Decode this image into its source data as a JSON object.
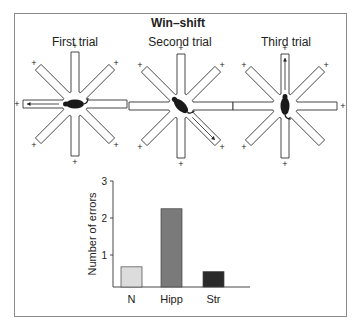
{
  "figure": {
    "title": "Win–shift",
    "trials": [
      {
        "label": "First trial",
        "rewarded_arms": [
          "N",
          "NE",
          "E",
          "SE",
          "S",
          "SW",
          "W",
          "NW"
        ],
        "visited_arm": "W",
        "rat_orientation": "facing-left"
      },
      {
        "label": "Second trial",
        "rewarded_arms": [
          "N",
          "NE",
          "E",
          "SE",
          "S",
          "SW",
          "NW"
        ],
        "visited_arm": "SE",
        "rat_orientation": "facing-down-right"
      },
      {
        "label": "Third trial",
        "rewarded_arms": [
          "N",
          "NE",
          "E",
          "S",
          "SW",
          "NW"
        ],
        "visited_arm": "N",
        "rat_orientation": "facing-up"
      }
    ],
    "reward_symbol": "+"
  },
  "chart_data": {
    "type": "bar",
    "title": "",
    "xlabel": "",
    "ylabel": "Number of errors",
    "categories": [
      "N",
      "Hipp",
      "Str"
    ],
    "values": [
      0.68,
      2.25,
      0.55
    ],
    "colors": [
      "#dcdcdc",
      "#7a7a7a",
      "#2a2a2a"
    ],
    "yticks": [
      1,
      2,
      3
    ],
    "ylim": [
      0,
      3.1
    ],
    "grid": false,
    "legend": "none"
  }
}
